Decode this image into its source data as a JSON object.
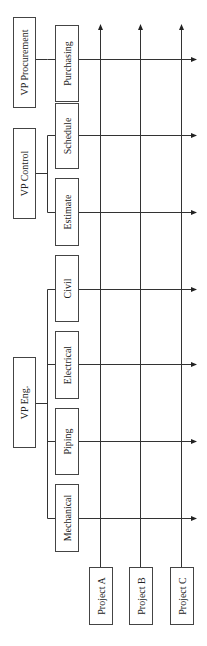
{
  "diagram": {
    "type": "matrix-organization-chart",
    "orientation": "rotated-90-ccw",
    "vice_presidents": [
      {
        "label": "VP Procurement",
        "departments": [
          "Purchasing"
        ]
      },
      {
        "label": "VP Control",
        "departments": [
          "Schedule",
          "Estimate"
        ]
      },
      {
        "label": "VP Eng.",
        "departments": [
          "Civil",
          "Electrical",
          "Piping",
          "Mechanical"
        ]
      }
    ],
    "projects": [
      {
        "label": "Project  A"
      },
      {
        "label": "Project  B"
      },
      {
        "label": "Project  C"
      }
    ],
    "colors": {
      "line": "#333333",
      "box_border": "#444444",
      "text": "#222222",
      "background": "#ffffff"
    }
  }
}
